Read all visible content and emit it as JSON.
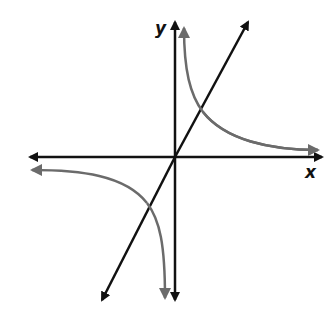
{
  "diagram": {
    "title": "",
    "axes": {
      "x_label": "x",
      "y_label": "y"
    },
    "elements": [
      {
        "type": "axis",
        "name": "x-axis",
        "arrows": "both"
      },
      {
        "type": "axis",
        "name": "y-axis",
        "arrows": "both"
      },
      {
        "type": "line",
        "name": "linear-function",
        "description": "straight line through origin with positive slope",
        "arrows": "both"
      },
      {
        "type": "curve",
        "name": "hyperbola-branch-quadrant-1",
        "description": "reciprocal curve branch in quadrant I"
      },
      {
        "type": "curve",
        "name": "hyperbola-branch-quadrant-3",
        "description": "reciprocal curve branch in quadrant III"
      }
    ],
    "colors": {
      "axis": "#111111",
      "line": "#111111",
      "curve": "#6b6b6b"
    }
  }
}
